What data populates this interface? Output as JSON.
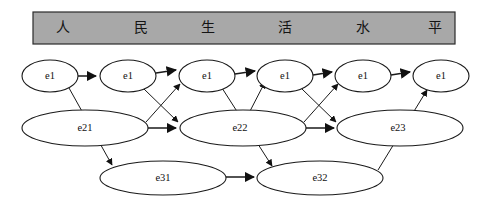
{
  "figure": {
    "canvas": {
      "width": 489,
      "height": 211
    },
    "background_color": "#ffffff",
    "line_color": "#1a1a1a"
  },
  "header": {
    "bar_color": "#a8a8a8",
    "border_color": "#2b2b2b",
    "rect": {
      "x": 33,
      "y": 12,
      "width": 422,
      "height": 32
    },
    "characters": [
      {
        "text": "人",
        "x": 63
      },
      {
        "text": "民",
        "x": 141
      },
      {
        "text": "生",
        "x": 208
      },
      {
        "text": "活",
        "x": 285
      },
      {
        "text": "水",
        "x": 363
      },
      {
        "text": "平",
        "x": 435
      }
    ]
  },
  "nodes": [
    {
      "id": "t1",
      "label": "e1",
      "cx": 50,
      "cy": 76,
      "rx": 28,
      "ry": 16
    },
    {
      "id": "t2",
      "label": "e1",
      "cx": 128,
      "cy": 76,
      "rx": 28,
      "ry": 16
    },
    {
      "id": "t3",
      "label": "e1",
      "cx": 207,
      "cy": 76,
      "rx": 28,
      "ry": 16
    },
    {
      "id": "t4",
      "label": "e1",
      "cx": 285,
      "cy": 76,
      "rx": 28,
      "ry": 16
    },
    {
      "id": "t5",
      "label": "e1",
      "cx": 363,
      "cy": 76,
      "rx": 28,
      "ry": 16
    },
    {
      "id": "t6",
      "label": "e1",
      "cx": 441,
      "cy": 76,
      "rx": 28,
      "ry": 16
    },
    {
      "id": "m1",
      "label": "e21",
      "cx": 85,
      "cy": 128,
      "rx": 63,
      "ry": 18
    },
    {
      "id": "m2",
      "label": "e22",
      "cx": 243,
      "cy": 128,
      "rx": 63,
      "ry": 18
    },
    {
      "id": "m3",
      "label": "e23",
      "cx": 400,
      "cy": 128,
      "rx": 63,
      "ry": 18
    },
    {
      "id": "b1",
      "label": "e31",
      "cx": 163,
      "cy": 178,
      "rx": 63,
      "ry": 17
    },
    {
      "id": "b2",
      "label": "e32",
      "cx": 320,
      "cy": 178,
      "rx": 63,
      "ry": 17
    }
  ],
  "edges": [
    {
      "from": "t1",
      "to": "t2"
    },
    {
      "from": "t2",
      "to": "t3"
    },
    {
      "from": "t3",
      "to": "t4"
    },
    {
      "from": "t4",
      "to": "t5"
    },
    {
      "from": "t5",
      "to": "t6"
    },
    {
      "from": "t1",
      "to": "b1"
    },
    {
      "from": "t2",
      "to": "m2"
    },
    {
      "from": "m1",
      "to": "t3"
    },
    {
      "from": "m1",
      "to": "m2"
    },
    {
      "from": "t3",
      "to": "b2"
    },
    {
      "from": "m2",
      "to": "t4"
    },
    {
      "from": "t4",
      "to": "m3"
    },
    {
      "from": "m2",
      "to": "m3"
    },
    {
      "from": "m2",
      "to": "t5"
    },
    {
      "from": "b1",
      "to": "b2"
    },
    {
      "from": "b2",
      "to": "t6"
    }
  ],
  "legend": {
    "node_levels": [
      "e1 (single-character)",
      "e21/e22/e23 (two-character)",
      "e31/e32 (three-character)"
    ]
  }
}
